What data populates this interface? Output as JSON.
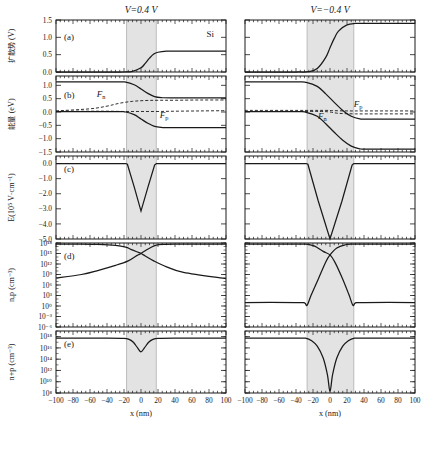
{
  "figure": {
    "panel_labels": [
      "(a)",
      "(b)",
      "(c)",
      "(d)",
      "(e)"
    ],
    "column_titles": [
      "V=0.4 V",
      "V=−0.4 V"
    ],
    "material_annotation": "Si",
    "xlabel": "x (nm)",
    "xticks": [
      "−100",
      "−80",
      "−60",
      "−40",
      "−20",
      "0",
      "20",
      "40",
      "60",
      "80",
      "100"
    ],
    "xlim": [
      -100,
      100
    ],
    "depletion_shading_color": "#e3e3e3",
    "curve_color": "#1a1a1a",
    "fermi_labels": {
      "electron": "F",
      "electron_sub": "n",
      "hole": "F",
      "hole_sub": "p"
    },
    "rows": [
      {
        "label": "(a)",
        "ylabel_cjk": "扩散势",
        "ylabel_unit": "(V)",
        "yticks": [
          "1.5",
          "1.0",
          "0.5",
          "0.0"
        ],
        "ylim": [
          0.0,
          1.5
        ]
      },
      {
        "label": "(b)",
        "ylabel_cjk": "能量",
        "ylabel_unit": "(eV)",
        "yticks": [
          "1.0",
          "0.5",
          "0.0",
          "−0.5",
          "−1.0",
          "−1.5"
        ],
        "ylim": [
          -1.5,
          1.35
        ]
      },
      {
        "label": "(c)",
        "ylabel_unit": "E(10⁵ V·cm⁻¹)",
        "yticks": [
          "0.0",
          "−1.0",
          "−2.0",
          "−3.0",
          "−4.0",
          "−5.0"
        ],
        "ylim": [
          -5.0,
          0.5
        ]
      },
      {
        "label": "(d)",
        "ylabel_unit": "n,p (cm⁻³)",
        "yticks": [
          "10¹⁸",
          "10¹⁵",
          "10¹²",
          "10⁹",
          "10⁶",
          "10³",
          "10⁰",
          "10⁻³",
          "10⁻⁶"
        ],
        "ylim": [
          -6,
          18
        ]
      },
      {
        "label": "(e)",
        "ylabel_unit": "n+p (cm⁻³)",
        "yticks": [
          "10¹⁸",
          "10¹⁶",
          "10¹⁴",
          "10¹²",
          "10¹⁰",
          "10⁸"
        ],
        "ylim": [
          8,
          19
        ]
      }
    ]
  },
  "chart_data": {
    "type": "line",
    "xlabel": "x (nm)",
    "xlim": [
      -100,
      100
    ],
    "panels": [
      {
        "id": "a-forward",
        "column": "V=0.4 V",
        "panel": "(a)",
        "ylabel": "扩散势 (V)",
        "ylim": [
          0.0,
          1.5
        ],
        "depletion_region": [
          -17,
          18
        ],
        "series": [
          {
            "name": "built-in potential",
            "style": "solid",
            "x": [
              -100,
              -40,
              -20,
              -10,
              0,
              5,
              10,
              15,
              20,
              30,
              40,
              100
            ],
            "y": [
              0.0,
              0.0,
              0.0,
              0.02,
              0.12,
              0.25,
              0.4,
              0.52,
              0.57,
              0.6,
              0.6,
              0.6
            ]
          }
        ]
      },
      {
        "id": "a-reverse",
        "column": "V=−0.4 V",
        "panel": "(a)",
        "ylabel": "扩散势 (V)",
        "ylim": [
          0.0,
          1.5
        ],
        "depletion_region": [
          -27,
          28
        ],
        "series": [
          {
            "name": "built-in potential",
            "style": "solid",
            "x": [
              -100,
              -40,
              -25,
              -15,
              -5,
              0,
              5,
              10,
              20,
              30,
              40,
              100
            ],
            "y": [
              0.0,
              0.0,
              0.01,
              0.1,
              0.42,
              0.7,
              0.97,
              1.18,
              1.36,
              1.4,
              1.4,
              1.4
            ]
          }
        ]
      },
      {
        "id": "b-forward",
        "column": "V=0.4 V",
        "panel": "(b)",
        "ylabel": "能量 (eV)",
        "ylim": [
          -1.5,
          1.35
        ],
        "depletion_region": [
          -17,
          18
        ],
        "series": [
          {
            "name": "conduction band Ec",
            "style": "solid",
            "x": [
              -100,
              -30,
              -18,
              -8,
              0,
              8,
              16,
              24,
              35,
              100
            ],
            "y": [
              1.13,
              1.13,
              1.12,
              1.02,
              0.86,
              0.7,
              0.58,
              0.54,
              0.53,
              0.53
            ]
          },
          {
            "name": "valence band Ev",
            "style": "solid",
            "x": [
              -100,
              -30,
              -18,
              -8,
              0,
              8,
              16,
              24,
              35,
              100
            ],
            "y": [
              0.01,
              0.01,
              0.0,
              -0.1,
              -0.26,
              -0.42,
              -0.54,
              -0.58,
              -0.59,
              -0.59
            ]
          },
          {
            "name": "electron quasi-Fermi level Fn",
            "style": "dashed",
            "x": [
              -100,
              -60,
              -40,
              -25,
              -10,
              5,
              20,
              40,
              70,
              100
            ],
            "y": [
              0.04,
              0.12,
              0.22,
              0.33,
              0.4,
              0.43,
              0.44,
              0.44,
              0.45,
              0.45
            ]
          },
          {
            "name": "hole quasi-Fermi level Fp",
            "style": "dashed",
            "x": [
              -100,
              -60,
              -40,
              -20,
              0,
              20,
              40,
              70,
              100
            ],
            "y": [
              0.03,
              0.03,
              0.03,
              0.02,
              0.02,
              0.02,
              0.03,
              0.04,
              0.05
            ]
          }
        ]
      },
      {
        "id": "b-reverse",
        "column": "V=−0.4 V",
        "panel": "(b)",
        "ylabel": "能量 (eV)",
        "ylim": [
          -1.5,
          1.35
        ],
        "depletion_region": [
          -27,
          28
        ],
        "series": [
          {
            "name": "conduction band Ec",
            "style": "solid",
            "x": [
              -100,
              -40,
              -28,
              -15,
              -5,
              5,
              15,
              25,
              35,
              45,
              100
            ],
            "y": [
              1.13,
              1.13,
              1.11,
              0.96,
              0.68,
              0.36,
              0.06,
              -0.16,
              -0.26,
              -0.27,
              -0.27
            ]
          },
          {
            "name": "valence band Ev",
            "style": "solid",
            "x": [
              -100,
              -40,
              -28,
              -15,
              -5,
              5,
              15,
              25,
              35,
              45,
              100
            ],
            "y": [
              0.01,
              0.01,
              -0.01,
              -0.16,
              -0.44,
              -0.76,
              -1.06,
              -1.28,
              -1.38,
              -1.39,
              -1.39
            ]
          },
          {
            "name": "electron quasi-Fermi level Fn",
            "style": "dashed",
            "x": [
              -100,
              -30,
              -10,
              0,
              10,
              30,
              60,
              100
            ],
            "y": [
              0.02,
              0.02,
              0.02,
              0.0,
              -0.05,
              -0.07,
              -0.07,
              -0.07
            ]
          },
          {
            "name": "hole quasi-Fermi level Fp",
            "style": "dashed",
            "x": [
              -100,
              -30,
              -5,
              5,
              20,
              40,
              70,
              100
            ],
            "y": [
              0.06,
              0.06,
              0.06,
              0.05,
              0.04,
              0.04,
              0.04,
              0.04
            ]
          }
        ]
      },
      {
        "id": "c-forward",
        "column": "V=0.4 V",
        "panel": "(c)",
        "ylabel": "E(10⁵ V·cm⁻¹)",
        "ylim": [
          -5.0,
          0.5
        ],
        "depletion_region": [
          -17,
          18
        ],
        "series": [
          {
            "name": "electric field",
            "style": "solid",
            "x": [
              -100,
              -18,
              -16,
              -8,
              0,
              8,
              16,
              18,
              100
            ],
            "y": [
              0.0,
              0.0,
              -0.05,
              -1.55,
              -3.15,
              -1.6,
              -0.1,
              0.0,
              0.0
            ]
          }
        ]
      },
      {
        "id": "c-reverse",
        "column": "V=−0.4 V",
        "panel": "(c)",
        "ylabel": "E(10⁵ V·cm⁻¹)",
        "ylim": [
          -5.0,
          0.5
        ],
        "depletion_region": [
          -27,
          28
        ],
        "series": [
          {
            "name": "electric field",
            "style": "solid",
            "x": [
              -100,
              -28,
              -26,
              -14,
              0,
              14,
              26,
              28,
              100
            ],
            "y": [
              0.0,
              0.0,
              -0.05,
              -2.45,
              -5.0,
              -2.5,
              -0.1,
              0.0,
              0.0
            ]
          }
        ]
      },
      {
        "id": "d-forward",
        "column": "V=0.4 V",
        "panel": "(d)",
        "ylabel": "n,p (cm⁻³)",
        "ylim": [
          -6,
          18
        ],
        "log_scale": true,
        "depletion_region": [
          -17,
          18
        ],
        "series": [
          {
            "name": "electron density n",
            "style": "solid",
            "x": [
              -100,
              -70,
              -50,
              -30,
              -15,
              -5,
              0,
              5,
              12,
              18,
              25,
              40,
              100
            ],
            "y": [
              8.0,
              9.0,
              10.2,
              11.6,
              12.9,
              14.4,
              15.0,
              15.8,
              16.8,
              17.4,
              17.6,
              17.7,
              17.7
            ]
          },
          {
            "name": "hole density p",
            "style": "solid",
            "x": [
              -100,
              -70,
              -50,
              -30,
              -18,
              -12,
              -5,
              0,
              5,
              15,
              30,
              50,
              100
            ],
            "y": [
              17.7,
              17.7,
              17.6,
              17.3,
              16.8,
              16.2,
              15.5,
              15.0,
              14.3,
              12.9,
              11.2,
              9.6,
              7.8
            ]
          }
        ]
      },
      {
        "id": "d-reverse",
        "column": "V=−0.4 V",
        "panel": "(d)",
        "ylabel": "n,p (cm⁻³)",
        "ylim": [
          -6,
          18
        ],
        "log_scale": true,
        "depletion_region": [
          -27,
          28
        ],
        "series": [
          {
            "name": "electron density n",
            "style": "solid",
            "x": [
              -100,
              -40,
              -30,
              -27,
              -22,
              -14,
              -5,
              0,
              8,
              18,
              26,
              30,
              40,
              100
            ],
            "y": [
              1.0,
              1.0,
              0.9,
              0.2,
              3.2,
              7.6,
              12.6,
              14.6,
              16.6,
              17.5,
              17.7,
              17.7,
              17.7,
              17.7
            ]
          },
          {
            "name": "hole density p",
            "style": "solid",
            "x": [
              -100,
              -40,
              -30,
              -26,
              -18,
              -8,
              0,
              6,
              14,
              22,
              27,
              30,
              40,
              100
            ],
            "y": [
              17.7,
              17.7,
              17.7,
              17.6,
              17.1,
              15.6,
              14.6,
              12.4,
              8.2,
              3.4,
              0.2,
              0.9,
              1.0,
              1.0
            ]
          }
        ]
      },
      {
        "id": "e-forward",
        "column": "V=0.4 V",
        "panel": "(e)",
        "ylabel": "n+p (cm⁻³)",
        "ylim": [
          8,
          19
        ],
        "log_scale": true,
        "depletion_region": [
          -17,
          18
        ],
        "series": [
          {
            "name": "total carrier density n+p",
            "style": "solid",
            "x": [
              -100,
              -40,
              -20,
              -14,
              -9,
              -4,
              0,
              4,
              9,
              14,
              20,
              40,
              100
            ],
            "y": [
              17.75,
              17.75,
              17.7,
              17.5,
              17.0,
              16.0,
              15.3,
              16.0,
              17.0,
              17.5,
              17.7,
              17.75,
              17.75
            ]
          }
        ]
      },
      {
        "id": "e-reverse",
        "column": "V=−0.4 V",
        "panel": "(e)",
        "ylabel": "n+p (cm⁻³)",
        "ylim": [
          8,
          19
        ],
        "log_scale": true,
        "depletion_region": [
          -27,
          28
        ],
        "series": [
          {
            "name": "total carrier density n+p",
            "style": "solid",
            "x": [
              -100,
              -40,
              -28,
              -22,
              -15,
              -8,
              -3,
              0,
              3,
              8,
              15,
              22,
              28,
              40,
              100
            ],
            "y": [
              17.75,
              17.75,
              17.7,
              17.3,
              16.3,
              14.2,
              11.2,
              8.3,
              11.2,
              14.2,
              16.3,
              17.3,
              17.7,
              17.75,
              17.75
            ]
          }
        ]
      }
    ]
  }
}
